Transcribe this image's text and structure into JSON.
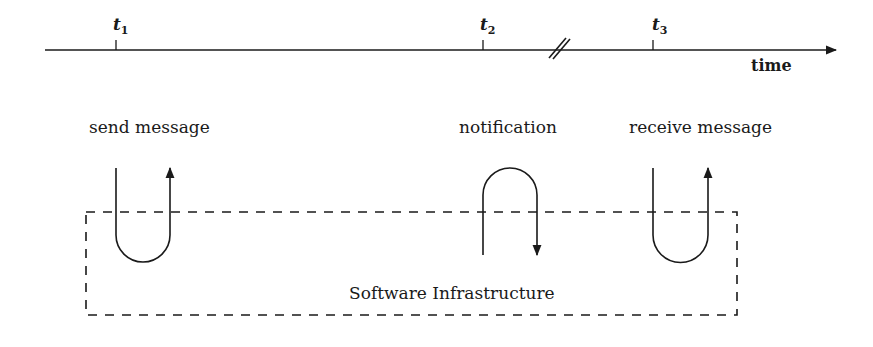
{
  "timeline": {
    "axis_label": "time",
    "ticks": [
      {
        "name": "t",
        "sub": "1"
      },
      {
        "name": "t",
        "sub": "2"
      },
      {
        "name": "t",
        "sub": "3"
      }
    ],
    "break_marker": "//"
  },
  "events": [
    {
      "label": "send message",
      "direction": "into and back out (U-turn, up arrow)"
    },
    {
      "label": "notification",
      "direction": "out and back in (inverted U, down arrow)"
    },
    {
      "label": "receive message",
      "direction": "into and back out (U-turn, up arrow)"
    }
  ],
  "infrastructure": {
    "label": "Software Infrastructure"
  },
  "colors": {
    "line": "#1a1a1a",
    "background": "#ffffff"
  }
}
